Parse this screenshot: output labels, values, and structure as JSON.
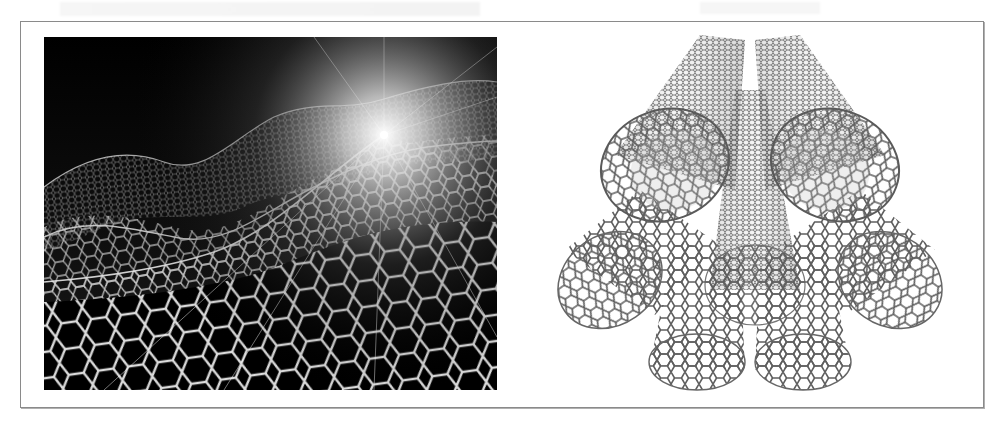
{
  "figure": {
    "panels": [
      {
        "id": "left",
        "subject": "graphene-sheet",
        "description": "Wavy graphene honeycomb lattice receding into a bright light burst on a black background",
        "colors": {
          "background": "#000000",
          "lattice": "#e8e8e8",
          "glow": "#ffffff"
        }
      },
      {
        "id": "right",
        "subject": "carbon-nanotube-bundle",
        "description": "Bundle of several carbon nanotubes with hexagonal walls fanning outward, on a white background",
        "colors": {
          "background": "#ffffff",
          "lattice": "#5a5a5a"
        }
      }
    ],
    "frame_color": "#8a8a8a"
  }
}
